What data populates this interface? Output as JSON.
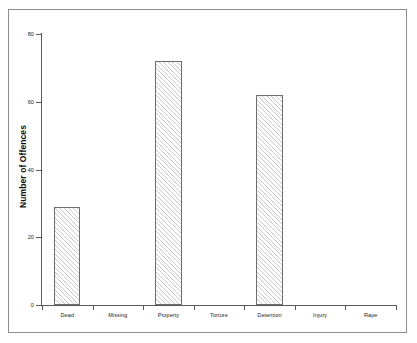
{
  "chart_data": {
    "type": "bar",
    "title": "",
    "subtitle": "",
    "xlabel": "",
    "ylabel": "Number of Offences",
    "categories": [
      "Dead",
      "Missing",
      "Property",
      "Torture",
      "Detention",
      "Injury",
      "Rape"
    ],
    "values": [
      29,
      0,
      72,
      0,
      62,
      0,
      0
    ],
    "series": [
      {
        "name": "Number of Offences",
        "values": [
          29,
          0,
          72,
          0,
          62,
          0,
          0
        ]
      }
    ],
    "ylim": [
      0,
      80
    ],
    "ytick_labels": [
      "0",
      "20",
      "40",
      "60",
      "80"
    ],
    "ytick_values": [
      0,
      20,
      40,
      60,
      80
    ],
    "grid": false,
    "legend": false,
    "legend_position": "none",
    "bar_fill": "diagonal-hatch",
    "bar_edge_color": "#6e6e6e",
    "hatch_color": "#c9c9c9",
    "axis_color": "#5a5a5a",
    "frame_color": "#8d8d8d",
    "background": "#ffffff"
  }
}
